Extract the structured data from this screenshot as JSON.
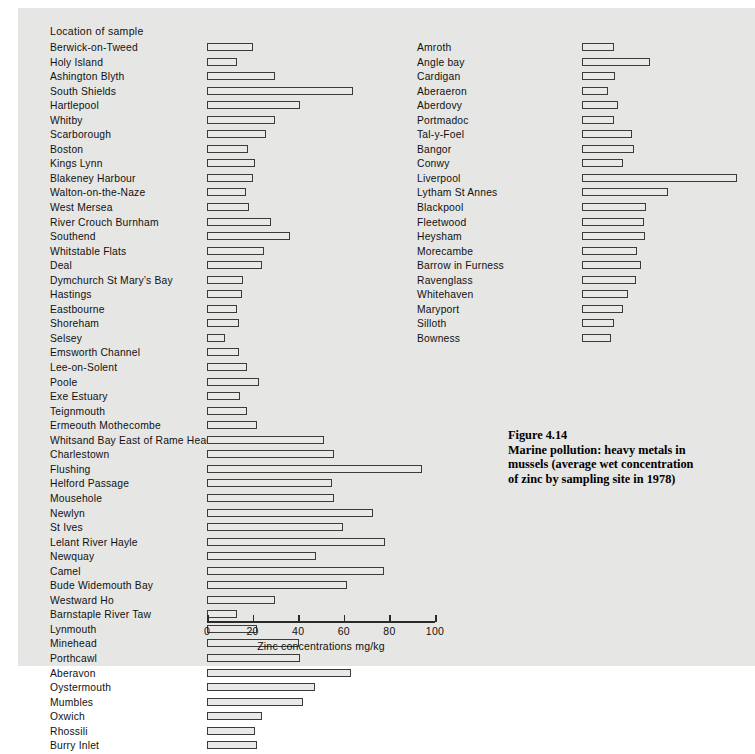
{
  "figure": {
    "caption_lines": [
      "Figure 4.14",
      "Marine pollution: heavy metals in",
      "mussels (average wet concentration",
      "of zinc by sampling site in 1978)"
    ]
  },
  "column_heading": "Location of sample",
  "chart_data": {
    "type": "bar",
    "orientation": "horizontal",
    "xlabel": "Zinc concentrations mg/kg",
    "ylabel": "Location of sample",
    "xlim": [
      0,
      100
    ],
    "xticks": [
      0,
      20,
      40,
      60,
      80,
      100
    ],
    "grid": false,
    "legend": null,
    "panels": [
      {
        "name": "left-column",
        "categories": [
          "Berwick-on-Tweed",
          "Holy Island",
          "Ashington Blyth",
          "South Shields",
          "Hartlepool",
          "Whitby",
          "Scarborough",
          "Boston",
          "Kings Lynn",
          "Blakeney Harbour",
          "Walton-on-the-Naze",
          "West Mersea",
          "River Crouch  Burnham",
          "Southend",
          "Whitstable Flats",
          "Deal",
          "Dymchurch  St Mary’s Bay",
          "Hastings",
          "Eastbourne",
          "Shoreham",
          "Selsey",
          "Emsworth Channel",
          "Lee-on-Solent",
          "Poole",
          "Exe Estuary",
          "Teignmouth",
          "Ermeouth  Mothecombe",
          "Whitsand Bay  East of Rame Head",
          "Charlestown",
          "Flushing",
          "Helford Passage",
          "Mousehole",
          "Newlyn",
          "St Ives",
          "Lelant  River Hayle",
          "Newquay",
          "Camel",
          "Bude  Widemouth Bay",
          "Westward Ho",
          "Barnstaple  River Taw",
          "Lynmouth",
          "Minehead",
          "Porthcawl",
          "Aberavon",
          "Oystermouth",
          "Mumbles",
          "Oxwich",
          "Rhossili",
          "Burry Inlet"
        ],
        "values": [
          20,
          13,
          30,
          64,
          41,
          30,
          26,
          18,
          21,
          20,
          17,
          18.5,
          28,
          36.5,
          25,
          24,
          16,
          15.5,
          13,
          14,
          8,
          14,
          17.5,
          23,
          14.5,
          17.5,
          22,
          51.5,
          55.5,
          94.5,
          55,
          55.5,
          73,
          59.5,
          78,
          48,
          77.5,
          61.5,
          30,
          13,
          22,
          40.5,
          41,
          63,
          47.5,
          42,
          24,
          21,
          22
        ]
      },
      {
        "name": "right-column",
        "categories": [
          "Amroth",
          "Angle bay",
          "Cardigan",
          "Aberaeron",
          "Aberdovy",
          "Portmadoc",
          "Tal-y-Foel",
          "Bangor",
          "Conwy",
          "Liverpool",
          "Lytham St Annes",
          "Blackpool",
          "Fleetwood",
          "Heysham",
          "Morecambe",
          "Barrow in Furness",
          "Ravenglass",
          "Whitehaven",
          "Maryport",
          "Silloth",
          "Bowness"
        ],
        "values": [
          14,
          30,
          14.5,
          11.5,
          16,
          14,
          22,
          23,
          18,
          68,
          37.5,
          28,
          27,
          27.5,
          24,
          26,
          23.5,
          20,
          18,
          14,
          12.5
        ]
      }
    ]
  },
  "axis": {
    "tick_labels": [
      "0",
      "20",
      "40",
      "60",
      "80",
      "100"
    ],
    "title": "Zinc concentrations mg/kg"
  },
  "colors": {
    "page_background": "#e6e6e4",
    "bar_fill": "#e9e9e7",
    "bar_stroke": "#3b3b3b",
    "text": "#111111"
  }
}
